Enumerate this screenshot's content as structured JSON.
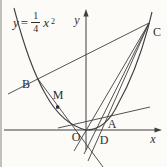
{
  "figure": {
    "equation": {
      "lhs": "y",
      "equals": "=",
      "numerator": "1",
      "denominator": "4",
      "variable": "x",
      "exponent": "2"
    },
    "axes": {
      "x_label": "x",
      "y_label": "y"
    },
    "points": {
      "B": {
        "label": "B"
      },
      "M": {
        "label": "M"
      },
      "C": {
        "label": "C"
      },
      "A": {
        "label": "A"
      },
      "D": {
        "label": "D"
      },
      "O": {
        "label": "O"
      }
    },
    "geometry": {
      "curve": "parabola y = (1/4)x^2 opening upward, vertex at O, passing through B (left branch) and A, C (right branch)",
      "segments": [
        "line B-C",
        "line C-O extended below the x-axis",
        "line C-A extended below the x-axis",
        "line C-D extended below the x-axis",
        "line through B and M crossing the x-axis near D",
        "shallow line through A rising to the right"
      ],
      "marked_point": "M shown with a solid square dot"
    },
    "colors": {
      "stroke": "#3f3f3f",
      "background": "#fcfbf8"
    }
  }
}
